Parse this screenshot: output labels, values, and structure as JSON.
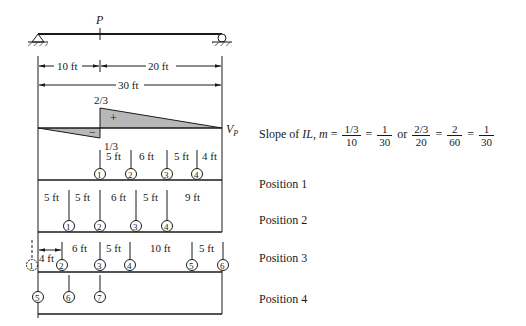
{
  "diagram": {
    "load_label": "P",
    "dimensions": {
      "left_span": "10 ft",
      "right_span": "20 ft",
      "total_span": "30 ft"
    },
    "influence_line": {
      "name": "V_P",
      "name_main": "V",
      "name_sub": "P",
      "positive_value": "2/3",
      "negative_value": "1/3",
      "positive_sign": "+",
      "negative_sign": "−",
      "fill_color": "#b8b8b8"
    },
    "slope": {
      "prefix": "Slope of ",
      "il": "IL",
      "m": "m",
      "eq": " = ",
      "frac1_num": "1/3",
      "frac1_den": "10",
      "frac2_num": "1",
      "frac2_den": "30",
      "or": " or ",
      "frac3_num": "2/3",
      "frac3_den": "20",
      "frac4_num": "2",
      "frac4_den": "60",
      "frac5_num": "1",
      "frac5_den": "30"
    },
    "positions": [
      {
        "label": "Position 1",
        "wheels": [
          "1",
          "2",
          "3",
          "4"
        ],
        "spacings": [
          "5 ft",
          "6 ft",
          "5 ft",
          "4 ft"
        ]
      },
      {
        "label": "Position 2",
        "wheels": [
          "1",
          "2",
          "3",
          "4"
        ],
        "spacings": [
          "5 ft",
          "5 ft",
          "6 ft",
          "5 ft",
          "9 ft"
        ]
      },
      {
        "label": "Position 3",
        "wheels": [
          "1",
          "2",
          "3",
          "4",
          "5",
          "6"
        ],
        "spacings": [
          "4 ft",
          "6 ft",
          "5 ft",
          "10 ft",
          "5 ft"
        ]
      },
      {
        "label": "Position 4",
        "wheels": [
          "5",
          "6",
          "7"
        ],
        "spacings": []
      }
    ]
  }
}
